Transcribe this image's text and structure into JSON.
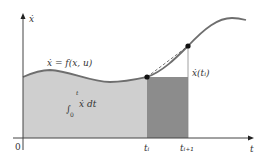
{
  "diagram": {
    "y_axis_label": "ẋ",
    "x_axis_label": "t",
    "origin_label": "0",
    "curve_label": "ẋ = f(x, u)",
    "integral_label": {
      "upper_limit": "t",
      "lower_limit": "0",
      "integrand": "ẋ dt"
    },
    "point_label": "ẋ(tᵢ)",
    "tick_labels": {
      "ti": "tᵢ",
      "ti1": "tᵢ₊₁"
    },
    "colors": {
      "light_area": "#cfcfcf",
      "dark_area": "#8c8c8c",
      "curve": "#6e6e6e",
      "axis": "#444444",
      "point": "#111111"
    }
  }
}
